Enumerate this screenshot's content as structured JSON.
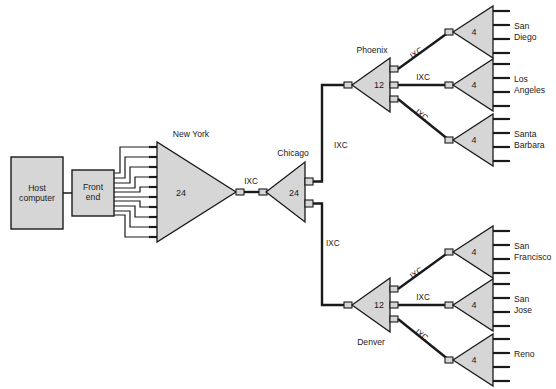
{
  "diagram": {
    "colors": {
      "node_fill": "#d6d6d6",
      "line": "#1a1a1a",
      "background": "#ffffff"
    },
    "host": {
      "line1": "Host",
      "line2": "computer"
    },
    "frontend": {
      "line1": "Front",
      "line2": "end"
    },
    "mux": {
      "new_york": {
        "label": "New York",
        "capacity": "24"
      },
      "chicago": {
        "label": "Chicago",
        "capacity": "24"
      },
      "phoenix": {
        "label": "Phoenix",
        "capacity": "12"
      },
      "denver": {
        "label": "Denver",
        "capacity": "12"
      }
    },
    "terminals": [
      {
        "id": "san-diego",
        "line1": "San",
        "line2": "Diego",
        "capacity": "4"
      },
      {
        "id": "los-angeles",
        "line1": "Los",
        "line2": "Angeles",
        "capacity": "4"
      },
      {
        "id": "santa-barbara",
        "line1": "Santa",
        "line2": "Barbara",
        "capacity": "4"
      },
      {
        "id": "san-francisco",
        "line1": "San",
        "line2": "Francisco",
        "capacity": "4"
      },
      {
        "id": "san-jose",
        "line1": "San",
        "line2": "Jose",
        "capacity": "4"
      },
      {
        "id": "reno",
        "line1": "Reno",
        "line2": "",
        "capacity": "4"
      }
    ],
    "links": {
      "ny_chicago": "IXC",
      "chicago_phoenix": "IXC",
      "chicago_denver": "IXC",
      "phoenix_san_diego": "IXC",
      "phoenix_los_angeles": "IXC",
      "phoenix_santa_barbara": "IXC",
      "denver_san_francisco": "IXC",
      "denver_san_jose": "IXC",
      "denver_reno": "IXC"
    }
  }
}
